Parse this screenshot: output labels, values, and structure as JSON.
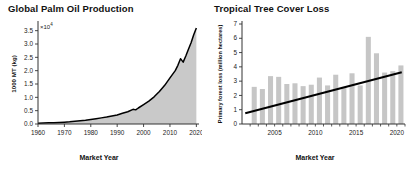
{
  "figure": {
    "background_color": "#ffffff",
    "line_color": "#000000",
    "fill_color": "#c9c9c9",
    "bar_color": "#c6c6c6",
    "axis_color": "#333333"
  },
  "panels": [
    {
      "id": "global-palm-oil-production",
      "title": "Global Palm Oil Production",
      "exponent_annotation": "×10",
      "exponent_superscript": "4"
    },
    {
      "id": "tropical-tree-cover-loss",
      "title": "Tropical Tree Cover Loss"
    }
  ],
  "chart_data": [
    {
      "type": "area",
      "title": "Global Palm Oil Production",
      "xlabel": "Market Year",
      "ylabel": "1000 MT (kg)",
      "y_multiplier": "×10⁴",
      "xlim": [
        1960,
        2021
      ],
      "ylim": [
        0.0,
        3.75
      ],
      "xticks": [
        1960,
        1970,
        1980,
        1990,
        2000,
        2010,
        2020
      ],
      "yticks": [
        0.0,
        0.5,
        1.0,
        1.5,
        2.0,
        2.5,
        3.0,
        3.5
      ],
      "ytick_labels": [
        "0.0",
        "0.5",
        "1.0",
        "1.5",
        "2.0",
        "2.5",
        "3.0",
        "3.5"
      ],
      "xtick_labels": [
        "1960",
        "1970",
        "1980",
        "1990",
        "2000",
        "2010",
        "2020"
      ],
      "grid": false,
      "legend": "none",
      "x": [
        1960,
        1962,
        1964,
        1966,
        1968,
        1970,
        1972,
        1974,
        1976,
        1978,
        1980,
        1982,
        1984,
        1986,
        1988,
        1990,
        1992,
        1994,
        1996,
        1997,
        1998,
        2000,
        2002,
        2004,
        2006,
        2008,
        2010,
        2012,
        2013,
        2014,
        2015,
        2016,
        2017,
        2018,
        2019,
        2020
      ],
      "values": [
        0.03,
        0.04,
        0.05,
        0.05,
        0.06,
        0.07,
        0.08,
        0.1,
        0.12,
        0.14,
        0.17,
        0.2,
        0.23,
        0.26,
        0.3,
        0.34,
        0.4,
        0.46,
        0.55,
        0.53,
        0.6,
        0.73,
        0.86,
        1.02,
        1.22,
        1.45,
        1.73,
        2.0,
        2.2,
        2.45,
        2.32,
        2.55,
        2.8,
        3.05,
        3.35,
        3.6
      ]
    },
    {
      "type": "bar",
      "title": "Tropical Tree Cover Loss",
      "xlabel": "Market Year",
      "ylabel": "Primary forest loss (million hectares)",
      "xlim": [
        2001,
        2021
      ],
      "ylim": [
        0,
        7
      ],
      "yticks": [
        0,
        1,
        2,
        3,
        4,
        5,
        6,
        7
      ],
      "ytick_labels": [
        "0",
        "1",
        "2",
        "3",
        "4",
        "5",
        "6",
        "7"
      ],
      "xticks": [
        2005,
        2010,
        2015,
        2020
      ],
      "xtick_labels": [
        "2005",
        "2010",
        "2015",
        "2020"
      ],
      "grid": false,
      "legend": "none",
      "categories": [
        2002,
        2003,
        2004,
        2005,
        2006,
        2007,
        2008,
        2009,
        2010,
        2011,
        2012,
        2013,
        2014,
        2015,
        2016,
        2017,
        2018,
        2019,
        2020
      ],
      "values": [
        2.6,
        2.45,
        3.35,
        3.3,
        2.8,
        2.85,
        2.65,
        2.75,
        3.25,
        2.7,
        3.45,
        2.6,
        3.55,
        2.7,
        6.1,
        4.95,
        3.6,
        3.7,
        4.1
      ],
      "series": [
        {
          "name": "Primary forest loss",
          "values": [
            2.6,
            2.45,
            3.35,
            3.3,
            2.8,
            2.85,
            2.65,
            2.75,
            3.25,
            2.7,
            3.45,
            2.6,
            3.55,
            2.7,
            6.1,
            4.95,
            3.6,
            3.7,
            4.1
          ]
        },
        {
          "name": "trend line",
          "type": "line",
          "x": [
            2001.4,
            2020.6
          ],
          "values": [
            0.75,
            3.62
          ]
        }
      ]
    }
  ]
}
